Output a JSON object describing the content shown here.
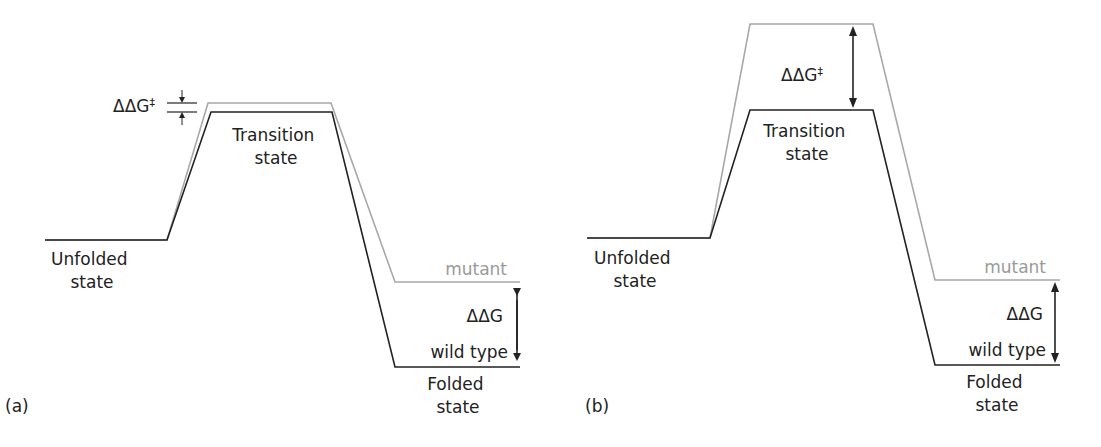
{
  "panels": [
    {
      "id": "a",
      "panel_label": "(a)",
      "unfolded_label": [
        "Unfolded",
        "state"
      ],
      "transition_label": [
        "Transition",
        "state"
      ],
      "folded_label": [
        "Folded",
        "state"
      ],
      "mutant_label": "mutant",
      "wildtype_label": "wild type",
      "ddg_label": "ΔΔG",
      "ddg_ts_label": "ΔΔG",
      "ddg_ts_superscript": "‡",
      "description": "Mutation destabilizes folded state; transition state nearly unchanged (small ΔΔG‡)"
    },
    {
      "id": "b",
      "panel_label": "(b)",
      "unfolded_label": [
        "Unfolded",
        "state"
      ],
      "transition_label": [
        "Transition",
        "state"
      ],
      "folded_label": [
        "Folded",
        "state"
      ],
      "mutant_label": "mutant",
      "wildtype_label": "wild type",
      "ddg_label": "ΔΔG",
      "ddg_ts_label": "ΔΔG",
      "ddg_ts_superscript": "‡",
      "description": "Mutation raises transition state by same amount as folded state destabilization (ΔΔG‡ ≈ ΔΔG)"
    }
  ],
  "colors": {
    "wild_type_line": "#222222",
    "mutant_line": "#a0a0a0",
    "text": "#222222",
    "mutant_text": "#9a9a9a"
  }
}
